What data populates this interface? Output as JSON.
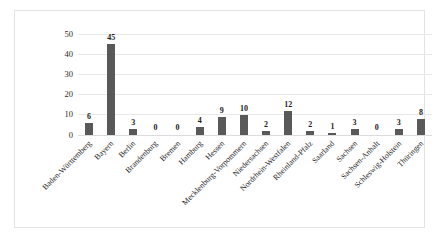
{
  "chart_data": {
    "type": "bar",
    "title": "",
    "subtitle": "",
    "xlabel": "",
    "ylabel": "",
    "ylim": [
      0,
      50
    ],
    "yticks": [
      0,
      10,
      20,
      30,
      40,
      50
    ],
    "grid": true,
    "legend": false,
    "legend_position": "none",
    "bar_color": "#595959",
    "gridline_color": "#e8e8e8",
    "categories": [
      "Baden-Württemberg",
      "Bayern",
      "Berlin",
      "Brandenburg",
      "Bremen",
      "Hamburg",
      "Hessen",
      "Mecklenburg-Vorpommern",
      "Niedersachsen",
      "Nordrhein-Westfalen",
      "Rheinland-Pfalz",
      "Saarland",
      "Sachsen",
      "Sachsen-Anhalt",
      "Schleswig-Holstein",
      "Thüringen"
    ],
    "values": [
      6,
      45,
      3,
      0,
      0,
      4,
      9,
      10,
      2,
      12,
      2,
      1,
      3,
      0,
      3,
      8
    ],
    "data_labels": [
      "6",
      "45",
      "3",
      "0",
      "0",
      "4",
      "9",
      "10",
      "2",
      "12",
      "2",
      "1",
      "3",
      "0",
      "3",
      "8"
    ],
    "ytick_labels": [
      "0",
      "10",
      "20",
      "30",
      "40",
      "50"
    ]
  }
}
